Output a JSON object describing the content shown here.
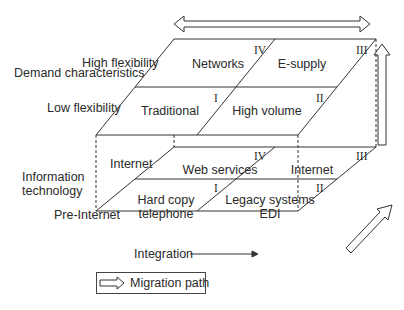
{
  "diagram": {
    "type": "two-layer migration cube",
    "axes": {
      "demand": {
        "title": "Demand characteristics",
        "levels": [
          "High flexibility",
          "Low flexibility"
        ]
      },
      "it": {
        "title": "Information technology",
        "levels": [
          "Internet",
          "Pre-Internet"
        ]
      },
      "integration": {
        "label": "Integration"
      }
    },
    "top_plane": {
      "cells": [
        {
          "quadrant": "IV",
          "label": "Networks"
        },
        {
          "quadrant": "III",
          "label": "E-supply"
        },
        {
          "quadrant": "I",
          "label": "Traditional"
        },
        {
          "quadrant": "II",
          "label": "High volume"
        }
      ]
    },
    "bottom_plane": {
      "row_labels": [
        "Internet",
        "Pre-Internet"
      ],
      "cells": [
        {
          "quadrant": "IV",
          "label": "Web services"
        },
        {
          "quadrant": "III",
          "label": "Internet"
        },
        {
          "quadrant": "I",
          "label_line1": "Hard copy",
          "label_line2": "telephone"
        },
        {
          "quadrant": "II",
          "label_line1": "Legacy systems",
          "label_line2": "EDI"
        }
      ]
    },
    "legend": {
      "label": "Migration path"
    }
  }
}
